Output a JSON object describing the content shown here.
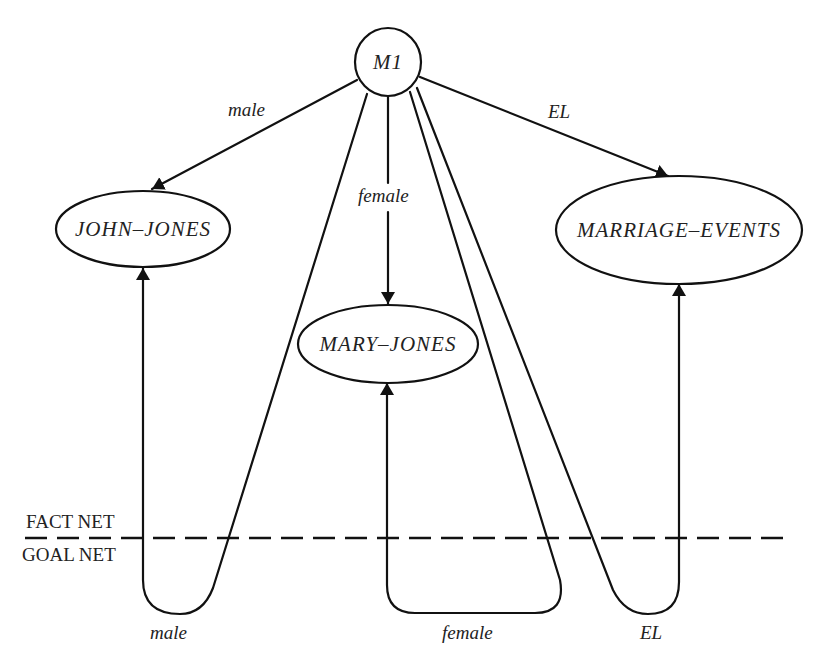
{
  "diagram": {
    "nodes": {
      "m1": {
        "label": "M1"
      },
      "john_jones": {
        "label": "JOHN–JONES"
      },
      "mary_jones": {
        "label": "MARY–JONES"
      },
      "marriage_events": {
        "label": "MARRIAGE–EVENTS"
      }
    },
    "edges": {
      "m1_to_john": {
        "label": "male"
      },
      "m1_to_mary": {
        "label": "female"
      },
      "m1_to_marriage": {
        "label": "EL"
      },
      "goal_male": {
        "label": "male"
      },
      "goal_female": {
        "label": "female"
      },
      "goal_el": {
        "label": "EL"
      }
    },
    "regions": {
      "fact_net": "FACT NET",
      "goal_net": "GOAL NET"
    },
    "colors": {
      "stroke": "#111111",
      "text": "#222222",
      "background": "#ffffff"
    }
  }
}
